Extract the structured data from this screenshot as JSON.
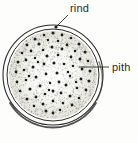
{
  "figure": {
    "background_color": "#fdfdfb",
    "ink_color": "#2a2a28",
    "stipple_color": "#8d8d86",
    "bundle_color": "#1c1c1a"
  },
  "labels": {
    "rind": {
      "text": "rind",
      "x": 70,
      "y": 12,
      "leader": {
        "x1": 68,
        "y1": 15,
        "x2": 57,
        "y2": 26
      },
      "marker": {
        "cx": 56,
        "cy": 27,
        "r": 1.6
      }
    },
    "pith": {
      "text": "pith",
      "x": 112,
      "y": 71,
      "leader": {
        "x1": 109,
        "y1": 67,
        "x2": 79,
        "y2": 67
      }
    }
  },
  "structures": {
    "rind_outer": {
      "cx": 53,
      "cy": 75,
      "rx": 50,
      "ry": 50
    },
    "rind_inner": {
      "cx": 53,
      "cy": 75,
      "rx": 46,
      "ry": 46
    },
    "pith_field": {
      "cx": 53,
      "cy": 75,
      "rx": 44,
      "ry": 44
    }
  },
  "chart_data": {
    "type": "scatter",
    "xlabel": "",
    "ylabel": "",
    "annotations": [
      "rind",
      "pith"
    ],
    "series": [
      {
        "name": "vascular bundles",
        "points": [
          [
            53,
            33,
            1.5
          ],
          [
            44,
            35,
            1.3
          ],
          [
            62,
            35,
            1.4
          ],
          [
            35,
            39,
            1.5
          ],
          [
            71,
            38,
            1.3
          ],
          [
            27,
            45,
            1.4
          ],
          [
            79,
            44,
            1.5
          ],
          [
            48,
            40,
            1.2
          ],
          [
            58,
            41,
            1.3
          ],
          [
            39,
            44,
            1.5
          ],
          [
            67,
            45,
            1.4
          ],
          [
            22,
            53,
            1.3
          ],
          [
            85,
            52,
            1.5
          ],
          [
            31,
            51,
            1.4
          ],
          [
            75,
            51,
            1.2
          ],
          [
            52,
            47,
            1.5
          ],
          [
            43,
            50,
            1.3
          ],
          [
            62,
            49,
            1.4
          ],
          [
            18,
            62,
            1.5
          ],
          [
            88,
            61,
            1.3
          ],
          [
            26,
            60,
            1.4
          ],
          [
            80,
            59,
            1.5
          ],
          [
            35,
            58,
            1.2
          ],
          [
            71,
            57,
            1.4
          ],
          [
            47,
            56,
            1.5
          ],
          [
            58,
            55,
            1.3
          ],
          [
            16,
            72,
            1.4
          ],
          [
            90,
            71,
            1.5
          ],
          [
            24,
            70,
            1.3
          ],
          [
            82,
            69,
            1.4
          ],
          [
            33,
            67,
            1.5
          ],
          [
            73,
            66,
            1.2
          ],
          [
            44,
            64,
            1.4
          ],
          [
            54,
            63,
            1.5
          ],
          [
            64,
            64,
            1.3
          ],
          [
            17,
            82,
            1.4
          ],
          [
            89,
            81,
            1.5
          ],
          [
            26,
            80,
            1.3
          ],
          [
            81,
            79,
            1.4
          ],
          [
            36,
            77,
            1.5
          ],
          [
            70,
            76,
            1.2
          ],
          [
            46,
            74,
            1.4
          ],
          [
            57,
            73,
            1.5
          ],
          [
            20,
            91,
            1.3
          ],
          [
            86,
            90,
            1.4
          ],
          [
            30,
            89,
            1.5
          ],
          [
            77,
            88,
            1.3
          ],
          [
            40,
            86,
            1.4
          ],
          [
            66,
            85,
            1.5
          ],
          [
            50,
            83,
            1.2
          ],
          [
            59,
            82,
            1.4
          ],
          [
            27,
            99,
            1.5
          ],
          [
            79,
            98,
            1.3
          ],
          [
            36,
            97,
            1.4
          ],
          [
            70,
            96,
            1.5
          ],
          [
            45,
            94,
            1.3
          ],
          [
            61,
            93,
            1.4
          ],
          [
            53,
            91,
            1.5
          ],
          [
            34,
            106,
            1.3
          ],
          [
            72,
            105,
            1.4
          ],
          [
            43,
            104,
            1.5
          ],
          [
            63,
            103,
            1.3
          ],
          [
            53,
            101,
            1.4
          ],
          [
            46,
            111,
            1.5
          ],
          [
            60,
            110,
            1.3
          ],
          [
            53,
            113,
            1.4
          ],
          [
            38,
            62,
            1.2
          ],
          [
            68,
            72,
            1.3
          ],
          [
            49,
            90,
            1.2
          ],
          [
            29,
            76,
            1.3
          ],
          [
            76,
            82,
            1.2
          ]
        ]
      }
    ]
  }
}
